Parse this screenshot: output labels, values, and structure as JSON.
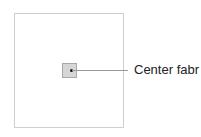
{
  "diagram": {
    "callout_label": "Center fabr",
    "colors": {
      "outer_border": "#cfcfcf",
      "square_fill": "#d6d6d6",
      "square_border": "#a8a8a8",
      "leader_line": "#9a9a9a",
      "text": "#222222"
    }
  }
}
